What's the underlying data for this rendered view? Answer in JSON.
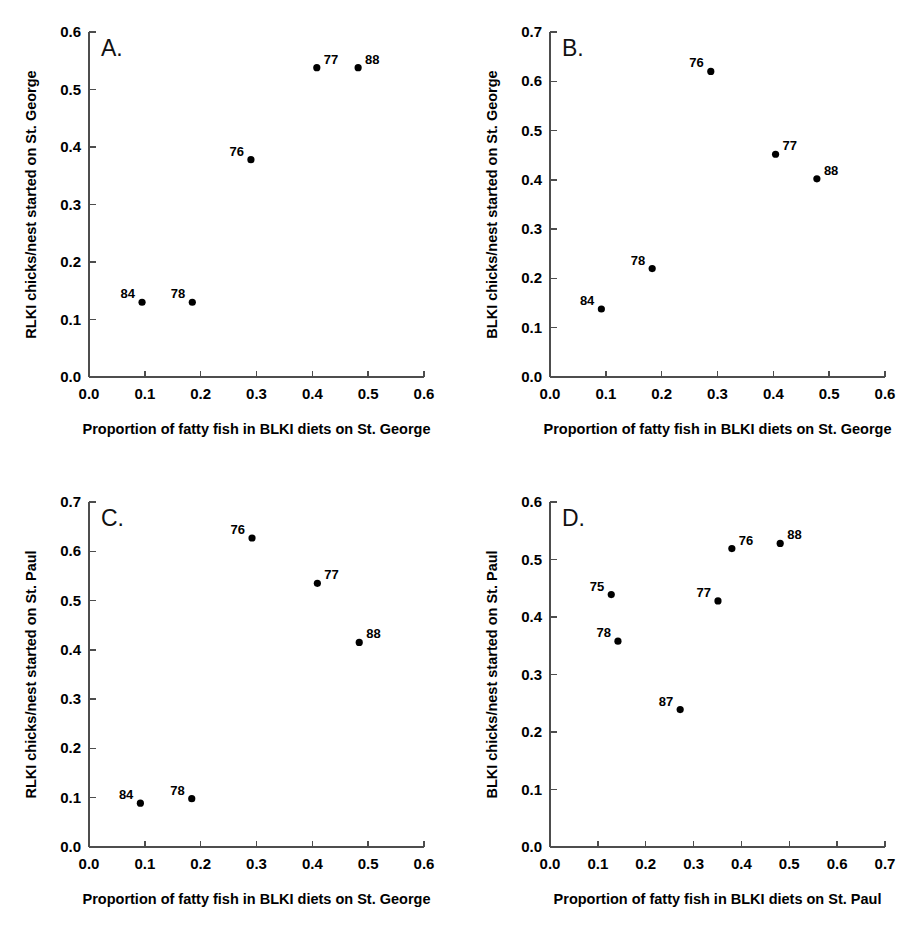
{
  "figure": {
    "title": "",
    "panel_count": 4,
    "marker_color": "#000000",
    "axis_color": "#4d4d4d",
    "background": "#ffffff"
  },
  "chart_data": [
    {
      "type": "scatter",
      "panel": "A.",
      "title": "",
      "xlabel": "Proportion of fatty fish in BLKI diets on St. George",
      "ylabel": "RLKI chicks/nest started on St. George",
      "xlim": [
        0.0,
        0.6
      ],
      "ylim": [
        0.0,
        0.6
      ],
      "xticks": [
        "0.0",
        "0.1",
        "0.2",
        "0.3",
        "0.4",
        "0.5",
        "0.6"
      ],
      "yticks": [
        "0.0",
        "0.1",
        "0.2",
        "0.3",
        "0.4",
        "0.5",
        "0.6"
      ],
      "grid": false,
      "legend": "none",
      "points": [
        {
          "label": "84",
          "x": 0.095,
          "y": 0.13,
          "label_side": "left"
        },
        {
          "label": "78",
          "x": 0.185,
          "y": 0.13,
          "label_side": "left"
        },
        {
          "label": "76",
          "x": 0.29,
          "y": 0.378,
          "label_side": "left"
        },
        {
          "label": "77",
          "x": 0.408,
          "y": 0.538,
          "label_side": "right"
        },
        {
          "label": "88",
          "x": 0.482,
          "y": 0.538,
          "label_side": "right"
        }
      ]
    },
    {
      "type": "scatter",
      "panel": "B.",
      "title": "",
      "xlabel": "Proportion of fatty fish in BLKI diets on St. George",
      "ylabel": "BLKI chicks/nest started on St. George",
      "xlim": [
        0.0,
        0.6
      ],
      "ylim": [
        0.0,
        0.7
      ],
      "xticks": [
        "0.0",
        "0.1",
        "0.2",
        "0.3",
        "0.4",
        "0.5",
        "0.6"
      ],
      "yticks": [
        "0.0",
        "0.1",
        "0.2",
        "0.3",
        "0.4",
        "0.5",
        "0.6",
        "0.7"
      ],
      "grid": false,
      "legend": "none",
      "points": [
        {
          "label": "84",
          "x": 0.092,
          "y": 0.138,
          "label_side": "left"
        },
        {
          "label": "78",
          "x": 0.183,
          "y": 0.22,
          "label_side": "left"
        },
        {
          "label": "76",
          "x": 0.288,
          "y": 0.62,
          "label_side": "left"
        },
        {
          "label": "77",
          "x": 0.404,
          "y": 0.452,
          "label_side": "right"
        },
        {
          "label": "88",
          "x": 0.478,
          "y": 0.402,
          "label_side": "right"
        }
      ]
    },
    {
      "type": "scatter",
      "panel": "C.",
      "title": "",
      "xlabel": "Proportion of fatty fish in BLKI diets on St. George",
      "ylabel": "RLKI chicks/nest started on St. Paul",
      "xlim": [
        0.0,
        0.6
      ],
      "ylim": [
        0.0,
        0.7
      ],
      "xticks": [
        "0.0",
        "0.1",
        "0.2",
        "0.3",
        "0.4",
        "0.5",
        "0.6"
      ],
      "yticks": [
        "0.0",
        "0.1",
        "0.2",
        "0.3",
        "0.4",
        "0.5",
        "0.6",
        "0.7"
      ],
      "grid": false,
      "legend": "none",
      "points": [
        {
          "label": "84",
          "x": 0.092,
          "y": 0.089,
          "label_side": "left"
        },
        {
          "label": "78",
          "x": 0.184,
          "y": 0.098,
          "label_side": "left"
        },
        {
          "label": "76",
          "x": 0.292,
          "y": 0.627,
          "label_side": "left"
        },
        {
          "label": "77",
          "x": 0.409,
          "y": 0.535,
          "label_side": "right"
        },
        {
          "label": "88",
          "x": 0.484,
          "y": 0.415,
          "label_side": "right"
        }
      ]
    },
    {
      "type": "scatter",
      "panel": "D.",
      "title": "",
      "xlabel": "Proportion of fatty fish in BLKI diets on St. Paul",
      "ylabel": "BLKI chicks/nest started on St. Paul",
      "xlim": [
        0.0,
        0.7
      ],
      "ylim": [
        0.0,
        0.6
      ],
      "xticks": [
        "0.0",
        "0.1",
        "0.2",
        "0.3",
        "0.4",
        "0.5",
        "0.6",
        "0.7"
      ],
      "yticks": [
        "0.0",
        "0.1",
        "0.2",
        "0.3",
        "0.4",
        "0.5",
        "0.6"
      ],
      "grid": false,
      "legend": "none",
      "points": [
        {
          "label": "75",
          "x": 0.128,
          "y": 0.439,
          "label_side": "left"
        },
        {
          "label": "78",
          "x": 0.142,
          "y": 0.358,
          "label_side": "left"
        },
        {
          "label": "87",
          "x": 0.272,
          "y": 0.239,
          "label_side": "left"
        },
        {
          "label": "77",
          "x": 0.351,
          "y": 0.428,
          "label_side": "left"
        },
        {
          "label": "76",
          "x": 0.38,
          "y": 0.519,
          "label_side": "right"
        },
        {
          "label": "88",
          "x": 0.481,
          "y": 0.528,
          "label_side": "right"
        }
      ]
    }
  ]
}
